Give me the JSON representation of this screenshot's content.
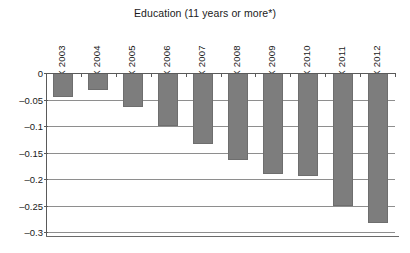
{
  "chart_data": {
    "type": "bar",
    "title": "Education (11 years or more*)",
    "xlabel": "",
    "ylabel": "",
    "categories": [
      "·X 2003",
      "·X 2004",
      "·X 2005",
      "·X 2006",
      "·X 2007",
      "·X 2008",
      "·X 2009",
      "·X 2010",
      "·X 2011",
      "·X 2012"
    ],
    "values": [
      -0.045,
      -0.033,
      -0.065,
      -0.1,
      -0.134,
      -0.165,
      -0.191,
      -0.195,
      -0.25,
      -0.283
    ],
    "ylim": [
      -0.3,
      0
    ],
    "ytick_labels": [
      "0",
      "–0.05",
      "–0.1",
      "–0.15",
      "–0.2",
      "–0.25",
      "–0.3"
    ],
    "ytick_values": [
      0,
      -0.05,
      -0.1,
      -0.15,
      -0.2,
      -0.25,
      -0.3
    ],
    "grid": true,
    "legend": "none",
    "bar_color": "#7d7d7d",
    "gridline_color": "#8e8e8e",
    "axis_color": "#5a5a5a",
    "background_color": "#ffffff"
  }
}
